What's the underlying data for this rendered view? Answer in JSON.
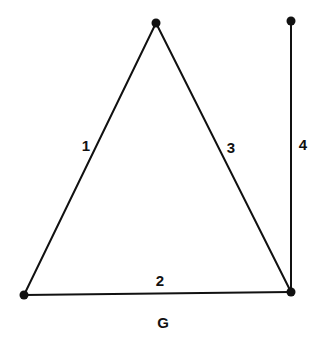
{
  "graph": {
    "name": "G",
    "vertices": [
      {
        "id": "top",
        "x": 156,
        "y": 23
      },
      {
        "id": "top-right",
        "x": 291,
        "y": 21
      },
      {
        "id": "bottom-left",
        "x": 24,
        "y": 295
      },
      {
        "id": "bottom-right",
        "x": 291,
        "y": 292
      }
    ],
    "edges": [
      {
        "label": "1",
        "from": "bottom-left",
        "to": "top",
        "label_x": 86,
        "label_y": 145
      },
      {
        "label": "2",
        "from": "bottom-left",
        "to": "bottom-right",
        "label_x": 160,
        "label_y": 280
      },
      {
        "label": "3",
        "from": "top",
        "to": "bottom-right",
        "label_x": 231,
        "label_y": 147
      },
      {
        "label": "4",
        "from": "top-right",
        "to": "bottom-right",
        "label_x": 303,
        "label_y": 144
      }
    ],
    "caption": {
      "text": "G",
      "x": 163,
      "y": 322
    },
    "color": "#111111"
  }
}
